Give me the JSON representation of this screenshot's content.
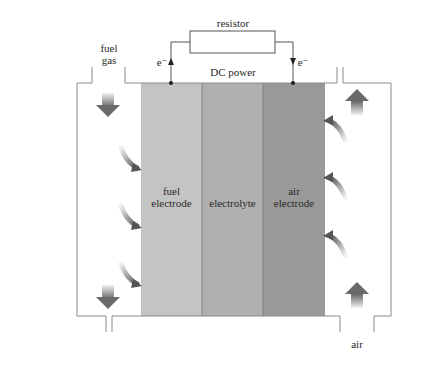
{
  "diagram": {
    "labels": {
      "resistor": "resistor",
      "dc_power": "DC power",
      "electron_left": "e⁻",
      "electron_right": "e⁻",
      "fuel_gas_line1": "fuel",
      "fuel_gas_line2": "gas",
      "fuel_electrode_line1": "fuel",
      "fuel_electrode_line2": "electrode",
      "electrolyte": "electrolyte",
      "air_electrode_line1": "air",
      "air_electrode_line2": "electrode",
      "air": "air"
    },
    "layers": [
      {
        "name": "fuel electrode",
        "color": "#c4c4c4"
      },
      {
        "name": "electrolyte",
        "color": "#b0b0b0"
      },
      {
        "name": "air electrode",
        "color": "#999999"
      }
    ],
    "colors": {
      "outline": "#8a8a8a",
      "arrow_dark": "#6a6a6a",
      "arrow_light": "#f0f0f0",
      "wire": "#444444"
    }
  }
}
